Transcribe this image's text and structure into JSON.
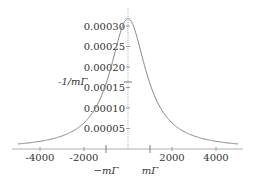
{
  "chart_data": {
    "type": "line",
    "title": "",
    "xlabel": "",
    "ylabel": "",
    "xlim": [
      -5000,
      5000
    ],
    "ylim": [
      0,
      0.00032
    ],
    "x_ticks": [
      "-4000",
      "-2000",
      "2000",
      "4000"
    ],
    "y_ticks": [
      "0.00005",
      "0.00010",
      "0.00015",
      "0.00020",
      "0.00025",
      "0.00030"
    ],
    "annotations": {
      "y_marker": "-1/mΓ",
      "x_marker_left": "−mΓ",
      "x_marker_right": "mΓ"
    },
    "series": [
      {
        "name": "Lorentzian",
        "x": [
          -5000,
          -4000,
          -3000,
          -2000,
          -1500,
          -1000,
          -500,
          0,
          500,
          1000,
          1500,
          2000,
          3000,
          4000,
          5000
        ],
        "values": [
          1.22e-05,
          1.87e-05,
          3.18e-05,
          6.37e-05,
          9.79e-05,
          0.000159,
          0.000255,
          0.000318,
          0.000255,
          0.000159,
          9.79e-05,
          6.37e-05,
          3.18e-05,
          1.87e-05,
          1.22e-05
        ]
      }
    ],
    "grid": false,
    "line_color": "#888888"
  }
}
